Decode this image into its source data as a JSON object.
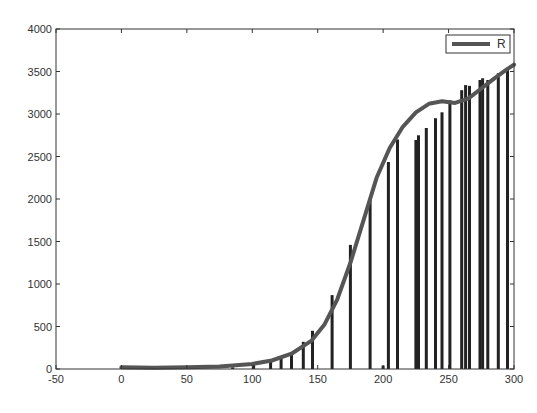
{
  "chart_data": {
    "type": "bar",
    "title": "",
    "xlabel": "",
    "ylabel": "",
    "xlim": [
      -50,
      300
    ],
    "ylim": [
      0,
      4000
    ],
    "grid": false,
    "legend_position": "upper right",
    "x_ticks": [
      -50,
      0,
      50,
      100,
      150,
      200,
      250,
      300
    ],
    "x_tick_labels": [
      "-50",
      "0",
      "50",
      "100",
      "150",
      "200",
      "250",
      "300"
    ],
    "y_ticks": [
      0,
      500,
      1000,
      1500,
      2000,
      2500,
      3000,
      3500,
      4000
    ],
    "y_tick_labels": [
      "0",
      "500",
      "1000",
      "1500",
      "2000",
      "2500",
      "3000",
      "3500",
      "4000"
    ],
    "series": [
      {
        "name": "data",
        "type": "bar",
        "color": "#222222",
        "x": [
          0,
          85,
          101,
          114,
          122,
          130,
          139,
          146,
          161,
          175,
          190,
          200,
          204,
          211,
          225,
          227,
          233,
          240,
          245,
          251,
          260,
          263,
          266,
          274,
          276,
          280,
          288,
          295
        ],
        "values": [
          30,
          20,
          60,
          95,
          130,
          200,
          320,
          450,
          870,
          1460,
          1990,
          40,
          2435,
          2700,
          2694,
          2750,
          2835,
          2950,
          3020,
          3160,
          3280,
          3340,
          3330,
          3400,
          3420,
          3400,
          3480,
          3540
        ]
      },
      {
        "name": "R",
        "type": "line",
        "color": "#555555",
        "x": [
          0,
          25,
          50,
          75,
          100,
          115,
          130,
          145,
          155,
          165,
          175,
          185,
          195,
          205,
          215,
          225,
          235,
          245,
          255,
          265,
          275,
          285,
          295,
          300
        ],
        "values": [
          20,
          15,
          20,
          30,
          60,
          100,
          180,
          330,
          520,
          820,
          1250,
          1750,
          2250,
          2600,
          2850,
          3020,
          3120,
          3150,
          3130,
          3180,
          3300,
          3420,
          3530,
          3580
        ]
      }
    ],
    "legend": [
      {
        "label": "R",
        "style": "thick-line",
        "color": "#555555"
      }
    ]
  }
}
